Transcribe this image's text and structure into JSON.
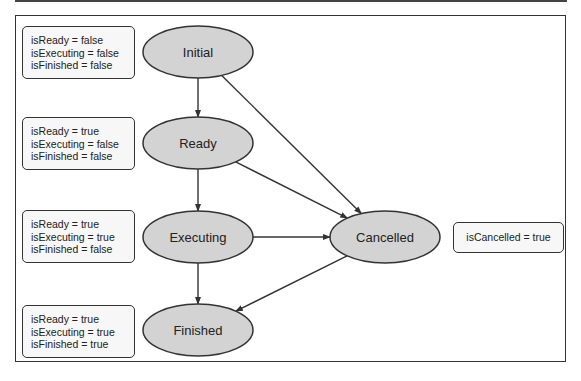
{
  "diagram": {
    "nodes": [
      {
        "id": "initial",
        "label": "Initial"
      },
      {
        "id": "ready",
        "label": "Ready"
      },
      {
        "id": "executing",
        "label": "Executing"
      },
      {
        "id": "finished",
        "label": "Finished"
      },
      {
        "id": "cancelled",
        "label": "Cancelled"
      }
    ],
    "edges": [
      {
        "from": "initial",
        "to": "ready"
      },
      {
        "from": "initial",
        "to": "cancelled"
      },
      {
        "from": "ready",
        "to": "executing"
      },
      {
        "from": "ready",
        "to": "cancelled"
      },
      {
        "from": "executing",
        "to": "cancelled"
      },
      {
        "from": "executing",
        "to": "finished"
      },
      {
        "from": "cancelled",
        "to": "finished"
      }
    ],
    "state_boxes": [
      {
        "for": "initial",
        "lines": [
          "isReady = false",
          "isExecuting = false",
          "isFinished = false"
        ]
      },
      {
        "for": "ready",
        "lines": [
          "isReady = true",
          "isExecuting = false",
          "isFinished = false"
        ]
      },
      {
        "for": "executing",
        "lines": [
          "isReady = true",
          "isExecuting = true",
          "isFinished = false"
        ]
      },
      {
        "for": "finished",
        "lines": [
          "isReady = true",
          "isExecuting = true",
          "isFinished = true"
        ]
      },
      {
        "for": "cancelled",
        "lines": [
          "isCancelled = true"
        ]
      }
    ],
    "colors": {
      "node_fill": "#d3d3d3",
      "stroke": "#333333",
      "box_fill": "#f7f7f7"
    }
  }
}
